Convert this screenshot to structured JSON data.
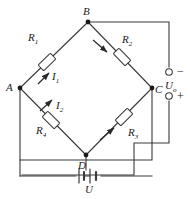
{
  "figure": {
    "type": "circuit-diagram",
    "name": "wheatstone-bridge",
    "line_color": "#3a3a3a",
    "text_color": "#1a1a1a",
    "background": "#ffffff"
  },
  "nodes": [
    {
      "id": "B",
      "label": "B",
      "x": 88,
      "y": 22,
      "label_x": 83,
      "label_y": 6
    },
    {
      "id": "A",
      "label": "A",
      "x": 20,
      "y": 88,
      "label_x": 6,
      "label_y": 82
    },
    {
      "id": "C",
      "label": "C",
      "x": 152,
      "y": 88,
      "label_x": 155,
      "label_y": 84
    },
    {
      "id": "D",
      "label": "D",
      "x": 86,
      "y": 155,
      "label_x": 78,
      "label_y": 160
    }
  ],
  "resistors": [
    {
      "id": "R1",
      "label": "R",
      "sub": "1",
      "label_x": 28,
      "label_y": 32
    },
    {
      "id": "R2",
      "label": "R",
      "sub": "2",
      "label_x": 122,
      "label_y": 34
    },
    {
      "id": "R3",
      "label": "R",
      "sub": "3",
      "label_x": 128,
      "label_y": 127
    },
    {
      "id": "R4",
      "label": "R",
      "sub": "4",
      "label_x": 36,
      "label_y": 125
    }
  ],
  "currents": [
    {
      "id": "I1",
      "label": "I",
      "sub": "1",
      "label_x": 52,
      "label_y": 71
    },
    {
      "id": "I2",
      "label": "I",
      "sub": "2",
      "label_x": 56,
      "label_y": 100
    }
  ],
  "source": {
    "id": "U",
    "label": "U",
    "sub": "",
    "label_x": 92,
    "label_y": 184,
    "symbol": "battery-icon"
  },
  "output": {
    "label": "U",
    "sub": "o",
    "label_x": 165,
    "label_y": 83,
    "terminals": [
      {
        "id": "minus",
        "sign": "−",
        "sign_x": 178,
        "sign_y": 66,
        "cx": 169,
        "cy": 72
      },
      {
        "id": "plus",
        "sign": "+",
        "sign_x": 178,
        "sign_y": 91,
        "cx": 169,
        "cy": 96
      }
    ]
  }
}
